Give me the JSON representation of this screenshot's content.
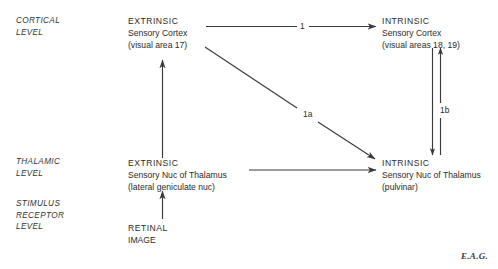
{
  "figure": {
    "background_color": "#ffffff",
    "line_color": "#3a3a3a",
    "signature": "E.A.G."
  },
  "levels": [
    {
      "id": "cortical",
      "label": "CORTICAL\nLEVEL"
    },
    {
      "id": "thalamic",
      "label": "THALAMIC\nLEVEL"
    },
    {
      "id": "stimulus-receptor",
      "label": "STIMULUS\nRECEPTOR\nLEVEL"
    }
  ],
  "nodes": [
    {
      "id": "extrinsic-sensory-cortex",
      "title": "EXTRINSIC",
      "subtitle": "Sensory Cortex",
      "detail": "(visual area 17)"
    },
    {
      "id": "intrinsic-sensory-cortex",
      "title": "INTRINSIC",
      "subtitle": "Sensory Cortex",
      "detail": "(visual areas 18, 19)"
    },
    {
      "id": "extrinsic-sensory-nuc-thalamus",
      "title": "EXTRINSIC",
      "subtitle": "Sensory Nuc of Thalamus",
      "detail": "(lateral geniculate nuc)"
    },
    {
      "id": "intrinsic-sensory-nuc-thalamus",
      "title": "INTRINSIC",
      "subtitle": "Sensory Nuc of Thalamus",
      "detail": "(pulvinar)"
    },
    {
      "id": "retinal-image",
      "title": "RETINAL",
      "subtitle": "IMAGE",
      "detail": ""
    }
  ],
  "connections": [
    {
      "id": "extrinsic-cortex-to-intrinsic-cortex",
      "label": "1",
      "from": "extrinsic-sensory-cortex",
      "to": "intrinsic-sensory-cortex",
      "direction": "right"
    },
    {
      "id": "extrinsic-cortex-to-intrinsic-thalamus",
      "label": "1a",
      "from": "extrinsic-sensory-cortex",
      "to": "intrinsic-sensory-nuc-thalamus",
      "direction": "diagonal-down-right"
    },
    {
      "id": "intrinsic-cortex-thalamus-reciprocal",
      "label": "1b",
      "from": "intrinsic-sensory-cortex",
      "to": "intrinsic-sensory-nuc-thalamus",
      "direction": "bidirectional-vertical"
    },
    {
      "id": "extrinsic-thalamus-to-intrinsic-thalamus",
      "label": "",
      "from": "extrinsic-sensory-nuc-thalamus",
      "to": "intrinsic-sensory-nuc-thalamus",
      "direction": "right"
    },
    {
      "id": "extrinsic-thalamus-to-extrinsic-cortex",
      "label": "",
      "from": "extrinsic-sensory-nuc-thalamus",
      "to": "extrinsic-sensory-cortex",
      "direction": "up"
    },
    {
      "id": "retinal-image-to-extrinsic-thalamus",
      "label": "",
      "from": "retinal-image",
      "to": "extrinsic-sensory-nuc-thalamus",
      "direction": "up"
    }
  ]
}
